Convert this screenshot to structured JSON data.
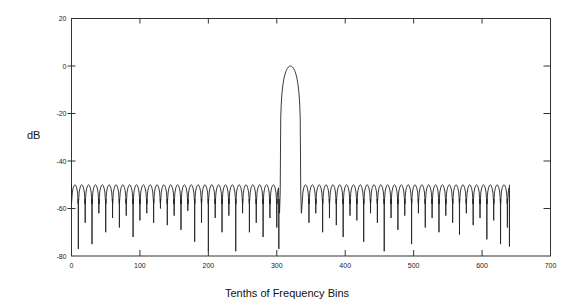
{
  "chart_data": {
    "type": "line",
    "title": "",
    "xlabel": "Tenths of Frequency Bins",
    "ylabel": "dB",
    "xlim": [
      0,
      700
    ],
    "ylim": [
      -80,
      20
    ],
    "xticks": [
      0,
      100,
      200,
      300,
      400,
      500,
      600,
      700
    ],
    "yticks": [
      20,
      0,
      -20,
      -40,
      -60,
      -80
    ],
    "grid": false,
    "legend": null,
    "series": [
      {
        "name": "spectrum",
        "color": "#222222",
        "description": "Sidelobe plateau near -50 dB with nulls every 10 units (one bin); main lobe peaking at 0 dB near x=320",
        "main_lobe": {
          "center": 320,
          "peak_db": 0,
          "left_edge": 305,
          "right_edge": 335,
          "edge_db": -53
        },
        "sidelobe_peak_db": -50,
        "lobe_spacing": 10,
        "x_start": 0,
        "x_end": 640,
        "null_depths_left": [
          -77,
          -66,
          -75,
          -62,
          -70,
          -64,
          -68,
          -63,
          -72,
          -65,
          -62,
          -66,
          -60,
          -67,
          -63,
          -69,
          -61,
          -74,
          -66,
          -78,
          -64,
          -70,
          -63,
          -78,
          -62,
          -70,
          -66,
          -72,
          -64,
          -68
        ],
        "null_depths_right": [
          -66,
          -62,
          -70,
          -64,
          -67,
          -72,
          -63,
          -65,
          -74,
          -62,
          -66,
          -78,
          -64,
          -69,
          -63,
          -75,
          -62,
          -68,
          -64,
          -70,
          -63,
          -66,
          -71,
          -62,
          -67,
          -64,
          -73,
          -65,
          -75,
          -68,
          -76,
          -70
        ]
      }
    ]
  },
  "axes": {
    "y_tick_labels": [
      "20",
      "0",
      "-20",
      "-40",
      "-60",
      "-80"
    ],
    "x_tick_labels": [
      "0",
      "100",
      "200",
      "300",
      "400",
      "500",
      "600",
      "700"
    ],
    "xlabel": "Tenths of Frequency Bins",
    "ylabel": "dB"
  }
}
